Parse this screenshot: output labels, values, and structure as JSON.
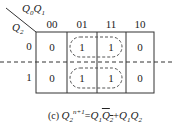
{
  "kmap": {
    "col_var_label": "Q0Q1",
    "row_var_label": "Q2",
    "col_headers": [
      "00",
      "01",
      "11",
      "10"
    ],
    "row_headers": [
      "0",
      "1"
    ],
    "cells": [
      [
        "0",
        "1",
        "1",
        "0"
      ],
      [
        "0",
        "1",
        "1",
        "0"
      ]
    ],
    "groups": [
      {
        "row": 0,
        "cols": [
          1,
          2
        ]
      },
      {
        "row": 1,
        "cols": [
          1,
          2
        ]
      }
    ]
  },
  "caption": {
    "prefix": "(c)",
    "lhs": "Q2^(n+1)",
    "rhs": "Q1·Q2' + Q1·Q2"
  }
}
